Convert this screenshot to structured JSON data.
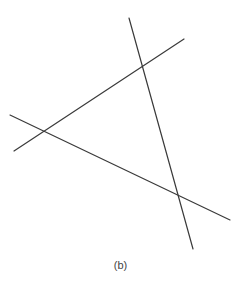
{
  "figure": {
    "caption": "(b)",
    "line_color": "#3a3a3a",
    "lines": [
      {
        "id": "steep-line"
      },
      {
        "id": "rising-line"
      },
      {
        "id": "falling-line"
      }
    ]
  }
}
